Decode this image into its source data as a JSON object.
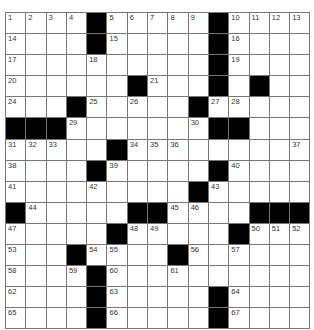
{
  "puzzle": {
    "rows": 15,
    "cols": 15,
    "colors": {
      "block": "#000000",
      "cell": "#ffffff",
      "line": "#777777",
      "number": "#333333"
    },
    "layout": [
      "....#.....#....",
      "....#.....#....",
      "..........#....",
      "......#...#.#..",
      "...#.....#.....",
      "###.......##...#",
      ".....#.........",
      "....#.....#....",
      ".........#.....",
      "#.....##....###",
      ".....#.....#...",
      "...#....#......",
      "....#..........",
      "....#.....#....",
      "....#.....#...."
    ],
    "numbers": [
      {
        "r": 0,
        "c": 0,
        "n": "1"
      },
      {
        "r": 0,
        "c": 1,
        "n": "2"
      },
      {
        "r": 0,
        "c": 2,
        "n": "3"
      },
      {
        "r": 0,
        "c": 3,
        "n": "4"
      },
      {
        "r": 0,
        "c": 5,
        "n": "5"
      },
      {
        "r": 0,
        "c": 6,
        "n": "6"
      },
      {
        "r": 0,
        "c": 7,
        "n": "7"
      },
      {
        "r": 0,
        "c": 8,
        "n": "8"
      },
      {
        "r": 0,
        "c": 9,
        "n": "9"
      },
      {
        "r": 0,
        "c": 11,
        "n": "10"
      },
      {
        "r": 0,
        "c": 12,
        "n": "11"
      },
      {
        "r": 0,
        "c": 13,
        "n": "12"
      },
      {
        "r": 0,
        "c": 14,
        "n": "13"
      },
      {
        "r": 1,
        "c": 0,
        "n": "14"
      },
      {
        "r": 1,
        "c": 5,
        "n": "15"
      },
      {
        "r": 1,
        "c": 11,
        "n": "16"
      },
      {
        "r": 2,
        "c": 0,
        "n": "17"
      },
      {
        "r": 2,
        "c": 4,
        "n": "18"
      },
      {
        "r": 2,
        "c": 11,
        "n": "19"
      },
      {
        "r": 3,
        "c": 0,
        "n": "20"
      },
      {
        "r": 3,
        "c": 7,
        "n": "21"
      },
      {
        "r": 3,
        "c": 10,
        "n": "22"
      },
      {
        "r": 3,
        "c": 12,
        "n": "23"
      },
      {
        "r": 4,
        "c": 0,
        "n": "24"
      },
      {
        "r": 4,
        "c": 4,
        "n": "25"
      },
      {
        "r": 4,
        "c": 6,
        "n": "26"
      },
      {
        "r": 4,
        "c": 10,
        "n": "27"
      },
      {
        "r": 4,
        "c": 11,
        "n": "28"
      },
      {
        "r": 5,
        "c": 3,
        "n": "29"
      },
      {
        "r": 5,
        "c": 9,
        "n": "30"
      },
      {
        "r": 6,
        "c": 0,
        "n": "31"
      },
      {
        "r": 6,
        "c": 1,
        "n": "32"
      },
      {
        "r": 6,
        "c": 2,
        "n": "33"
      },
      {
        "r": 6,
        "c": 6,
        "n": "34"
      },
      {
        "r": 6,
        "c": 7,
        "n": "35"
      },
      {
        "r": 6,
        "c": 8,
        "n": "36"
      },
      {
        "r": 6,
        "c": 14,
        "n": "37"
      },
      {
        "r": 7,
        "c": 0,
        "n": "38"
      },
      {
        "r": 7,
        "c": 5,
        "n": "39"
      },
      {
        "r": 7,
        "c": 11,
        "n": "40"
      },
      {
        "r": 8,
        "c": 0,
        "n": "41"
      },
      {
        "r": 8,
        "c": 4,
        "n": "42"
      },
      {
        "r": 8,
        "c": 10,
        "n": "43"
      },
      {
        "r": 9,
        "c": 1,
        "n": "44"
      },
      {
        "r": 9,
        "c": 8,
        "n": "45"
      },
      {
        "r": 9,
        "c": 9,
        "n": "46"
      },
      {
        "r": 10,
        "c": 0,
        "n": "47"
      },
      {
        "r": 10,
        "c": 6,
        "n": "48"
      },
      {
        "r": 10,
        "c": 7,
        "n": "49"
      },
      {
        "r": 10,
        "c": 12,
        "n": "50"
      },
      {
        "r": 10,
        "c": 13,
        "n": "51"
      },
      {
        "r": 10,
        "c": 14,
        "n": "52"
      },
      {
        "r": 11,
        "c": 0,
        "n": "53"
      },
      {
        "r": 11,
        "c": 4,
        "n": "54"
      },
      {
        "r": 11,
        "c": 5,
        "n": "55"
      },
      {
        "r": 11,
        "c": 9,
        "n": "56"
      },
      {
        "r": 11,
        "c": 11,
        "n": "57"
      },
      {
        "r": 12,
        "c": 0,
        "n": "58"
      },
      {
        "r": 12,
        "c": 3,
        "n": "59"
      },
      {
        "r": 12,
        "c": 5,
        "n": "60"
      },
      {
        "r": 12,
        "c": 8,
        "n": "61"
      },
      {
        "r": 13,
        "c": 0,
        "n": "62"
      },
      {
        "r": 13,
        "c": 5,
        "n": "63"
      },
      {
        "r": 13,
        "c": 11,
        "n": "64"
      },
      {
        "r": 14,
        "c": 0,
        "n": "65"
      },
      {
        "r": 14,
        "c": 5,
        "n": "66"
      },
      {
        "r": 14,
        "c": 11,
        "n": "67"
      }
    ]
  }
}
